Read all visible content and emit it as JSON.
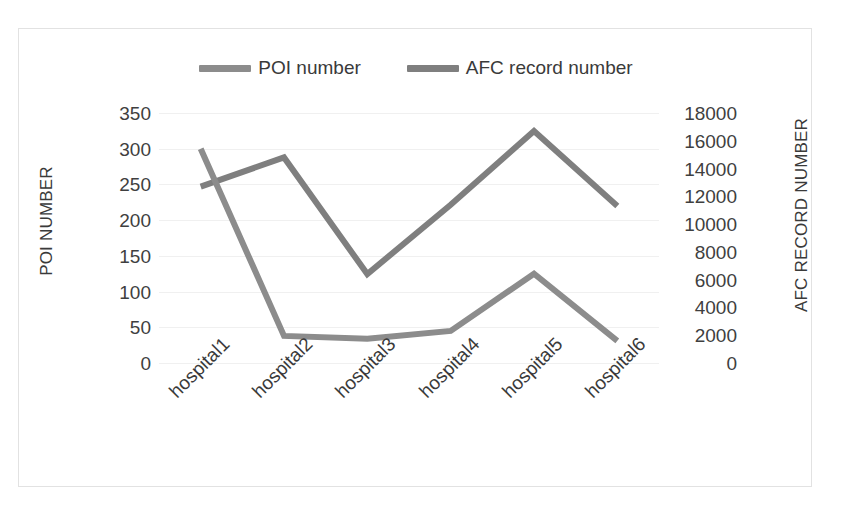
{
  "legend": {
    "entries": [
      {
        "label": "POI number",
        "color": "#8c8c8c",
        "key": "poi"
      },
      {
        "label": "AFC record number",
        "color": "#7f7f7f",
        "key": "afc"
      }
    ]
  },
  "axes": {
    "left": {
      "title": "POI NUMBER",
      "ticks": [
        "350",
        "300",
        "250",
        "200",
        "150",
        "100",
        "50",
        "0"
      ]
    },
    "right": {
      "title": "AFC RECORD NUMBER",
      "ticks": [
        "18000",
        "16000",
        "14000",
        "12000",
        "10000",
        "8000",
        "6000",
        "4000",
        "2000",
        "0"
      ]
    },
    "categories": [
      "hospital1",
      "hospital2",
      "hospital3",
      "hospital4",
      "hospital5",
      "hospital6"
    ]
  },
  "chart_data": {
    "type": "line",
    "title": "",
    "xlabel": "",
    "ylabel": "POI NUMBER",
    "y2label": "AFC RECORD NUMBER",
    "categories": [
      "hospital1",
      "hospital2",
      "hospital3",
      "hospital4",
      "hospital5",
      "hospital6"
    ],
    "ylim": [
      0,
      350
    ],
    "y2lim": [
      0,
      18000
    ],
    "ytick_step": 50,
    "y2tick_step": 2000,
    "grid": true,
    "legend_position": "top",
    "series": [
      {
        "name": "POI number",
        "axis": "left",
        "color": "#8c8c8c",
        "values": [
          300,
          38,
          34,
          45,
          125,
          31
        ]
      },
      {
        "name": "AFC record number",
        "axis": "right",
        "color": "#7f7f7f",
        "values": [
          12700,
          14800,
          6400,
          11400,
          16700,
          11300
        ]
      }
    ]
  }
}
